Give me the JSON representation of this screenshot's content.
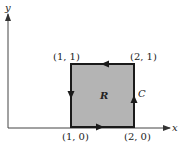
{
  "diagram": {
    "axes": {
      "x_label": "x",
      "y_label": "y"
    },
    "region_label": "R",
    "curve_label": "C",
    "vertices": [
      {
        "name": "bottom-left",
        "label": "(1, 0)",
        "x": 1,
        "y": 0
      },
      {
        "name": "bottom-right",
        "label": "(2, 0)",
        "x": 2,
        "y": 0
      },
      {
        "name": "top-right",
        "label": "(2, 1)",
        "x": 2,
        "y": 1
      },
      {
        "name": "top-left",
        "label": "(1, 1)",
        "x": 1,
        "y": 1
      }
    ],
    "orientation": "counterclockwise",
    "colors": {
      "region_fill": "#b4b4b4",
      "stroke": "#1a1a1a"
    }
  }
}
